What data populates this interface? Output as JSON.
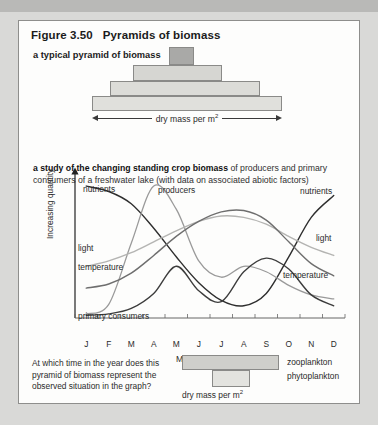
{
  "figure": {
    "number": "Figure 3.50",
    "title": "Pyramids of biomass",
    "section_a_label": "a typical pyramid of biomass",
    "section_b_label_bold": "a study of the changing standing crop biomass",
    "section_b_label_rest": " of producers and primary consumers of a freshwater lake (with data on associated abiotic factors)",
    "dry_mass_label": "dry mass per m",
    "dry_mass_sup": "2"
  },
  "pyramid": {
    "levels": [
      {
        "name": "level-4-top",
        "x": 169,
        "y": 47,
        "w": 25,
        "h": 18,
        "fill": "#a9a9a7"
      },
      {
        "name": "level-3",
        "x": 133,
        "y": 65,
        "w": 89,
        "h": 16,
        "fill": "#d6d6d2"
      },
      {
        "name": "level-2",
        "x": 110,
        "y": 81,
        "w": 150,
        "h": 15,
        "fill": "#dcdcd8"
      },
      {
        "name": "level-1-bottom",
        "x": 92,
        "y": 96,
        "w": 190,
        "h": 15,
        "fill": "#e0e0dc"
      }
    ],
    "arrow": {
      "x": 92,
      "y": 118,
      "w": 190
    }
  },
  "chart_data": {
    "type": "line",
    "title": "changing standing crop biomass of producers and primary consumers of a freshwater lake",
    "xlabel": "Months",
    "ylabel": "Increasing quantity",
    "categories": [
      "J",
      "F",
      "M",
      "A",
      "M",
      "J",
      "J",
      "A",
      "S",
      "O",
      "N",
      "D"
    ],
    "grid": false,
    "legend": "inline-curve-labels",
    "axis": {
      "x0": 75,
      "x1": 345,
      "y_top": 176,
      "y_bottom": 318
    },
    "series": [
      {
        "name": "nutrients",
        "color": "#2e2e2e",
        "width": 1.4,
        "labels": [
          {
            "text": "nutrients",
            "x": 83,
            "y": 184
          },
          {
            "text": "nutrients",
            "x": 300,
            "y": 186
          }
        ],
        "values": [
          0.97,
          0.93,
          0.84,
          0.66,
          0.45,
          0.26,
          0.13,
          0.09,
          0.18,
          0.45,
          0.74,
          0.9
        ]
      },
      {
        "name": "producers",
        "color": "#9a9a9a",
        "width": 1.3,
        "labels": [
          {
            "text": "producers",
            "x": 158,
            "y": 185
          }
        ],
        "values": [
          0.03,
          0.1,
          0.55,
          0.97,
          0.8,
          0.42,
          0.3,
          0.38,
          0.34,
          0.24,
          0.17,
          0.14
        ]
      },
      {
        "name": "primary consumers",
        "color": "#3c3c3c",
        "width": 1.4,
        "labels": [
          {
            "text": "primary consumers",
            "x": 78,
            "y": 311
          }
        ],
        "values": [
          0.02,
          0.03,
          0.07,
          0.18,
          0.38,
          0.2,
          0.12,
          0.34,
          0.44,
          0.36,
          0.17,
          0.09
        ]
      },
      {
        "name": "light",
        "color": "#b4b4b2",
        "width": 1.4,
        "labels": [
          {
            "text": "light",
            "x": 78,
            "y": 243
          },
          {
            "text": "light",
            "x": 316,
            "y": 233
          }
        ],
        "values": [
          0.38,
          0.42,
          0.48,
          0.56,
          0.64,
          0.71,
          0.75,
          0.74,
          0.69,
          0.6,
          0.52,
          0.46
        ]
      },
      {
        "name": "temperature",
        "color": "#6e6e6e",
        "width": 1.4,
        "labels": [
          {
            "text": "temperature",
            "x": 78,
            "y": 262
          },
          {
            "text": "temperature",
            "x": 283,
            "y": 270
          }
        ],
        "values": [
          0.22,
          0.25,
          0.33,
          0.46,
          0.6,
          0.71,
          0.78,
          0.79,
          0.72,
          0.56,
          0.4,
          0.31
        ]
      }
    ]
  },
  "question": {
    "text": "At which time in the year does this pyramid of biomass represent the observed situation in the graph?"
  },
  "bottom_pyramid": {
    "bars": [
      {
        "name": "zooplankton-bar",
        "x": 182,
        "y": 355,
        "w": 97,
        "h": 15,
        "fill": "#cfcfcb"
      },
      {
        "name": "phytoplankton-bar",
        "x": 212,
        "y": 370,
        "w": 38,
        "h": 17,
        "fill": "#e3e3df"
      }
    ],
    "labels": {
      "zooplankton": "zooplankton",
      "phytoplankton": "phytoplankton"
    },
    "dry_mass_label": "dry mass per m",
    "dry_mass_sup": "2"
  }
}
